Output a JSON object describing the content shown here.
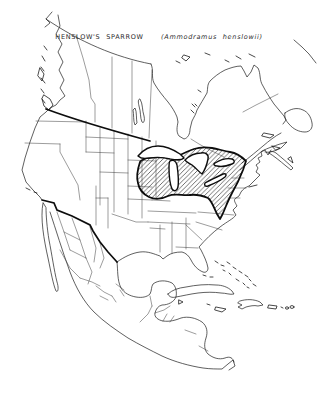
{
  "title": {
    "common_name": "HENSLOW'S SPARROW",
    "scientific_name": "(Ammodramus henslowii)"
  },
  "map": {
    "background_color": "#ffffff",
    "line_color": "#1b1b1b",
    "border_line_color": "#0d0d0d",
    "range_fill_style": "diagonal-hatch",
    "range_hatch_color": "#111111"
  }
}
